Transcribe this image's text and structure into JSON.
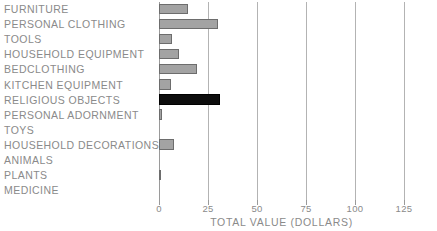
{
  "chart_data": {
    "type": "bar",
    "orientation": "horizontal",
    "title": "",
    "xlabel": "TOTAL VALUE (DOLLARS)",
    "ylabel": "",
    "xlim": [
      0,
      131
    ],
    "xticks": [
      0,
      25,
      50,
      75,
      100,
      125
    ],
    "xtick_labels": [
      "0",
      "25",
      "50",
      "75",
      "100",
      "125"
    ],
    "grid": "vertical",
    "legend": "none",
    "categories": [
      "FURNITURE",
      "PERSONAL CLOTHING",
      "TOOLS",
      "HOUSEHOLD EQUIPMENT",
      "BEDCLOTHING",
      "KITCHEN EQUIPMENT",
      "RELIGIOUS OBJECTS",
      "PERSONAL ADORNMENT",
      "TOYS",
      "HOUSEHOLD DECORATIONS",
      "ANIMALS",
      "PLANTS",
      "MEDICINE"
    ],
    "values": [
      15,
      30,
      6.5,
      10,
      19.5,
      6,
      31,
      1.5,
      0,
      7.5,
      0,
      1,
      0
    ],
    "highlight_index": 6,
    "colors": {
      "bar_fill": "#a3a3a3",
      "bar_edge": "#6d6d6d",
      "highlight_fill": "#0d0d0d",
      "highlight_edge": "#000000",
      "gridline": "#b3b3b3",
      "text": "#8a8a8a",
      "background": "#ffffff"
    }
  },
  "top_clipped_text": "",
  "axis": {
    "title": "TOTAL VALUE (DOLLARS)"
  }
}
